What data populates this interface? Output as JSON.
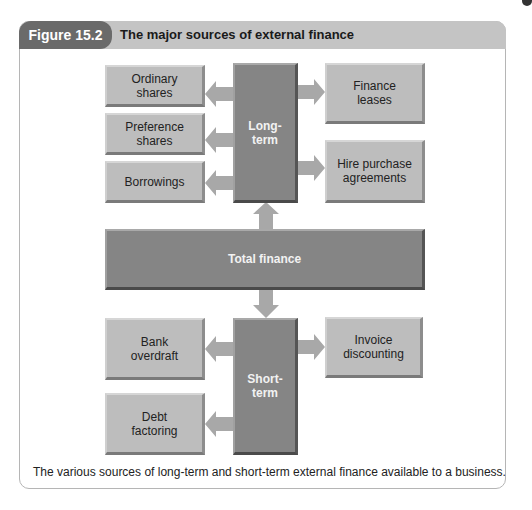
{
  "figure": {
    "label": "Figure 15.2",
    "title": "The major sources of external finance",
    "caption": "The various sources of long-term and short-term external finance available to a business."
  },
  "diagram": {
    "center": {
      "label": "Total finance"
    },
    "long_term": {
      "label": "Long-\nterm",
      "left": [
        "Ordinary\nshares",
        "Preference\nshares",
        "Borrowings"
      ],
      "right": [
        "Finance\nleases",
        "Hire purchase\nagreements"
      ]
    },
    "short_term": {
      "label": "Short-\nterm",
      "left": [
        "Bank\noverdraft",
        "Debt\nfactoring"
      ],
      "right": [
        "Invoice\ndiscounting"
      ]
    },
    "colors": {
      "header_dark": "#6a6a6a",
      "header_light": "#c4c4c4",
      "box_light": "#bdbdbd",
      "box_dark": "#858585",
      "arrow": "#a8a8a8"
    }
  }
}
